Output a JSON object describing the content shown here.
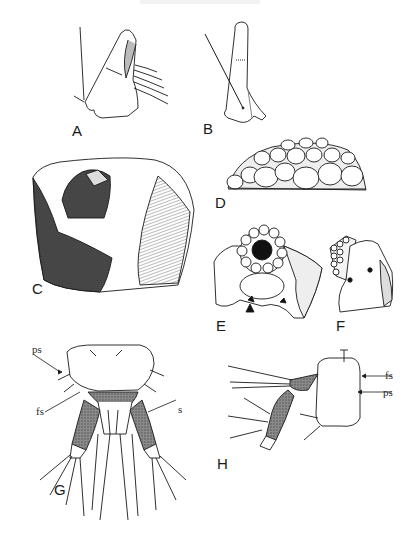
{
  "figure": {
    "panels": [
      {
        "id": "A",
        "label": "A",
        "description": "lateral view of appendage with setae"
      },
      {
        "id": "B",
        "label": "B",
        "description": "elongated appendage with seta"
      },
      {
        "id": "C",
        "label": "C",
        "description": "shaded fragment with clustered plates"
      },
      {
        "id": "D",
        "label": "D",
        "description": "mound of rounded grains"
      },
      {
        "id": "E",
        "label": "E",
        "description": "opening surrounded by small grains"
      },
      {
        "id": "F",
        "label": "F",
        "description": "lateral view of grain cluster"
      },
      {
        "id": "G",
        "label": "G",
        "description": "dorsal view of terminal segment with appendages"
      },
      {
        "id": "H",
        "label": "H",
        "description": "lateral view of terminal segment with appendage"
      }
    ],
    "annotations": {
      "G": {
        "ps": "ps",
        "fs": "fs",
        "s": "s"
      },
      "H": {
        "fs": "fs",
        "ps": "ps"
      }
    },
    "colors": {
      "ink": "#1a1a1a",
      "stipple": "#6b6b6b",
      "dark_shade": "#2b2b2b",
      "background": "#ffffff"
    }
  }
}
